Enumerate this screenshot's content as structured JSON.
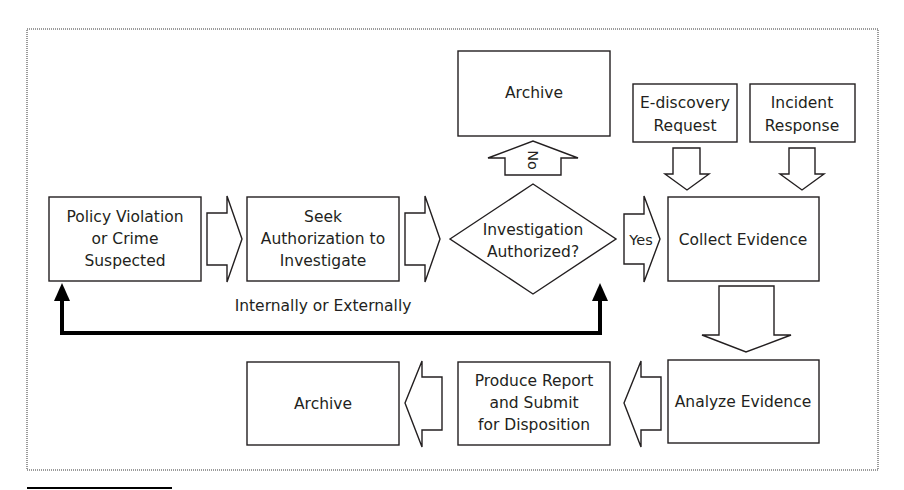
{
  "diagram": {
    "type": "flowchart",
    "title": "",
    "nodes": {
      "policy_violation": {
        "lines": [
          "Policy Violation",
          "or Crime",
          "Suspected"
        ]
      },
      "seek_authorization": {
        "lines": [
          "Seek",
          "Authorization to",
          "Investigate"
        ]
      },
      "decision": {
        "lines": [
          "Investigation",
          "Authorized?"
        ]
      },
      "archive_top": {
        "lines": [
          "Archive"
        ]
      },
      "ediscovery": {
        "lines": [
          "E-discovery",
          "Request"
        ]
      },
      "incident_response": {
        "lines": [
          "Incident",
          "Response"
        ]
      },
      "collect_evidence": {
        "lines": [
          "Collect Evidence"
        ]
      },
      "analyze_evidence": {
        "lines": [
          "Analyze Evidence"
        ]
      },
      "produce_report": {
        "lines": [
          "Produce Report",
          "and Submit",
          "for Disposition"
        ]
      },
      "archive_bottom": {
        "lines": [
          "Archive"
        ]
      }
    },
    "edges": {
      "no_label": "No",
      "yes_label": "Yes",
      "loop_label": "Internally or Externally"
    },
    "colors": {
      "stroke": "#231f20",
      "frame": "#9a9a9a",
      "fill": "#ffffff",
      "loop": "#000000"
    }
  }
}
